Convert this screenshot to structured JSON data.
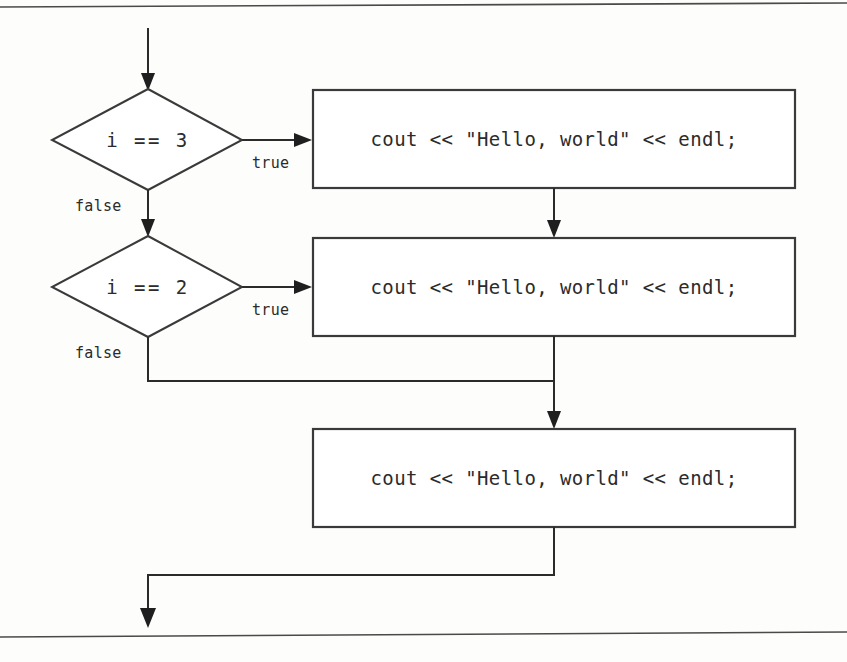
{
  "diagram": {
    "type": "flowchart",
    "colors": {
      "background": "#fdfdfc",
      "stroke": "#2b2b2b",
      "box_stroke": "#3a3a3a",
      "text": "#2b2b2b",
      "rule": "#4a4a4a"
    },
    "rules": {
      "top_label": "page-rule-top",
      "bottom_label": "page-rule-bottom"
    },
    "nodes": {
      "decision_1": {
        "label": "i == 3",
        "kind": "decision"
      },
      "decision_2": {
        "label": "i == 2",
        "kind": "decision"
      },
      "process_1": {
        "label": "cout << \"Hello, world\" << endl;",
        "kind": "process"
      },
      "process_2": {
        "label": "cout << \"Hello, world\" << endl;",
        "kind": "process"
      },
      "process_3": {
        "label": "cout << \"Hello, world\" << endl;",
        "kind": "process"
      }
    },
    "edges": {
      "entry": {
        "label": ""
      },
      "d1_true": {
        "label": "true"
      },
      "d1_false": {
        "label": "false"
      },
      "d2_true": {
        "label": "true"
      },
      "d2_false": {
        "label": "false"
      },
      "p1_to_p2": {
        "label": ""
      },
      "merge_to_p3": {
        "label": ""
      },
      "exit": {
        "label": ""
      }
    }
  }
}
